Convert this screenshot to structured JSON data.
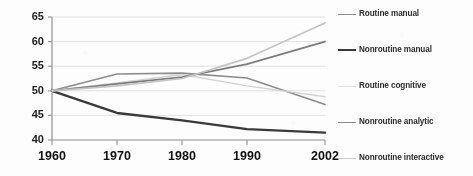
{
  "chart_data": {
    "type": "line",
    "title": "",
    "subtitle": "",
    "xlabel": "",
    "ylabel": "",
    "x": [
      1960,
      1970,
      1980,
      1990,
      2002
    ],
    "xtick_labels": [
      "1960",
      "1970",
      "1980",
      "1990",
      "2002"
    ],
    "ytick_labels": [
      "40",
      "45",
      "50",
      "55",
      "60",
      "65"
    ],
    "yticks": [
      40,
      45,
      50,
      55,
      60,
      65
    ],
    "ylim": [
      40,
      65
    ],
    "xlim": [
      1960,
      2002
    ],
    "grid": "horizontal",
    "legend_position": "right",
    "series": [
      {
        "name": "Routine manual",
        "color": "#8c8c8c",
        "width": 1.6,
        "values": [
          50.0,
          53.4,
          53.6,
          52.6,
          47.2
        ]
      },
      {
        "name": "Nonroutine manual",
        "color": "#3a3a3a",
        "width": 2.4,
        "values": [
          50.0,
          45.5,
          44.0,
          42.2,
          41.5
        ]
      },
      {
        "name": "Routine cognitive",
        "color": "#d2d2d2",
        "width": 1.5,
        "values": [
          50.0,
          51.6,
          53.3,
          51.0,
          48.8
        ]
      },
      {
        "name": "Nonroutine analytic",
        "color": "#7d7d7d",
        "width": 1.8,
        "values": [
          50.0,
          51.4,
          52.8,
          55.4,
          60.0
        ]
      },
      {
        "name": "Nonroutine interactive",
        "color": "#c4c4c4",
        "width": 1.7,
        "values": [
          50.0,
          51.0,
          52.5,
          56.6,
          63.8
        ]
      }
    ]
  },
  "axis": {
    "y_ticks": [
      {
        "label": "65",
        "value": 65
      },
      {
        "label": "60",
        "value": 60
      },
      {
        "label": "55",
        "value": 55
      },
      {
        "label": "50",
        "value": 50
      },
      {
        "label": "45",
        "value": 45
      },
      {
        "label": "40",
        "value": 40
      }
    ],
    "x_ticks": [
      {
        "label": "1960",
        "value": 1960
      },
      {
        "label": "1970",
        "value": 1970
      },
      {
        "label": "1980",
        "value": 1980
      },
      {
        "label": "1990",
        "value": 1990
      },
      {
        "label": "2002",
        "value": 2002
      }
    ]
  },
  "legend": {
    "items": [
      {
        "label": "Routine manual",
        "color": "#8c8c8c",
        "width": 1.6
      },
      {
        "label": "Nonroutine manual",
        "color": "#3a3a3a",
        "width": 2.6
      },
      {
        "label": "Routine cognitive",
        "color": "#dcdcdc",
        "width": 1.4
      },
      {
        "label": "Nonroutine analytic",
        "color": "#8a8a8a",
        "width": 1.6
      },
      {
        "label": "Nonroutine interactive",
        "color": "#c9c9c9",
        "width": 1.6
      }
    ]
  },
  "colors": {
    "background": "#fdfdfd",
    "axis": "#9a9a9a",
    "grid": "#dedede",
    "text": "#141414"
  }
}
